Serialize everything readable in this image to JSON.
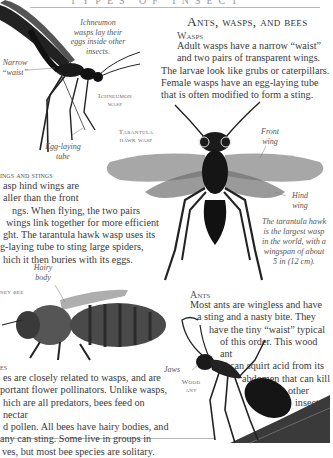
{
  "page": {
    "running_head": "TYPES OF INSECT",
    "title": "Ants, wasps, and bees"
  },
  "wasps": {
    "heading": "Wasps",
    "lines": [
      "Adult wasps have a narrow “waist”",
      "and two pairs of transparent wings.",
      "The larvae look like grubs or caterpillars.",
      "Female wasps have an egg-laying tube",
      "that is often modified to form a sting."
    ]
  },
  "wings_stings": {
    "heading": "ings and stings",
    "lines": [
      "asp hind wings are",
      "aller than the front",
      "ngs. When flying, the two pairs",
      "wings link together for more efficient",
      "ght. The tarantula hawk wasp uses its",
      "g-laying tube to sting large spiders,",
      "hich it then buries with its eggs."
    ]
  },
  "bees": {
    "heading": "es",
    "lines": [
      "es are closely related to wasps, and are",
      "portant flower pollinators. Unlike wasps,",
      "hich are all predators, bees feed on nectar",
      "d pollen. All bees have hairy bodies, and",
      "any can sting. Some live in groups in",
      "ves, but most bee species are solitary."
    ]
  },
  "ants": {
    "heading": "Ants",
    "lines": [
      "Most ants are wingless and have",
      "a sting and a nasty bite. They",
      "have the tiny “waist” typical",
      "of this order. This wood ant",
      "can squirt acid from its",
      "abdomen that can kill",
      "other",
      "insects."
    ]
  },
  "labels": {
    "ichneumon_caption": [
      "Ichneumon",
      "wasps lay their",
      "eggs inside other",
      "insects."
    ],
    "narrow_waist": [
      "Narrow",
      "“waist”"
    ],
    "ichneumon_wasp": [
      "Ichneumon",
      "wasp"
    ],
    "egg_laying_tube": [
      "Egg-laying",
      "tube"
    ],
    "tarantula_hawk_wasp": [
      "Tarantula",
      "hawk wasp"
    ],
    "front_wing": [
      "Front",
      "wing"
    ],
    "hind_wing": [
      "Hind",
      "wing"
    ],
    "tarantula_caption": [
      "The tarantula hawk",
      "is the largest wasp",
      "in the world, with a",
      "wingspan of about",
      "5 in (12 cm)."
    ],
    "hairy_body": [
      "Hairy",
      "body"
    ],
    "honey_bee": "ney bee",
    "jaws": "Jaws",
    "wood_ant": [
      "Wood",
      "ant"
    ]
  },
  "colors": {
    "text": "#3a3a3a",
    "rule": "#b8b8b8",
    "background": "#ffffff"
  }
}
